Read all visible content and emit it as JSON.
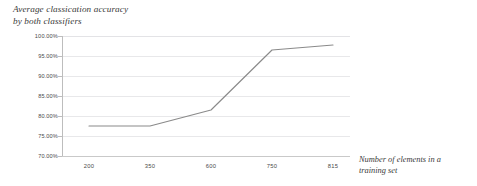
{
  "chart_data": {
    "type": "line",
    "title": "Average  classication accuracy by both classifiers",
    "title_line1": "Average  classication accuracy",
    "title_line2": "by both classifiers",
    "xlabel": "Number of elements in a training set",
    "xlabel_line1": "Number of elements in a",
    "xlabel_line2": "training set",
    "ylabel": "",
    "categories": [
      "200",
      "350",
      "600",
      "750",
      "815"
    ],
    "x": [
      200,
      350,
      600,
      750,
      815
    ],
    "values": [
      77.5,
      77.5,
      81.5,
      96.5,
      97.75
    ],
    "series": [
      {
        "name": "Average classication accuracy by both classifiers",
        "values": [
          77.5,
          77.5,
          81.5,
          96.5,
          97.75
        ]
      }
    ],
    "ylim": [
      70,
      100
    ],
    "y_ticks": [
      100,
      95,
      90,
      85,
      80,
      75,
      70
    ],
    "y_tick_labels": [
      "100.00%",
      "95.00%",
      "90.00%",
      "85.00%",
      "80.00%",
      "75.00%",
      "70.00%"
    ],
    "x_tick_labels": [
      "200",
      "350",
      "600",
      "750",
      "815"
    ],
    "grid": true,
    "grid_axis": "y",
    "legend": false,
    "legend_position": "none",
    "line_color": "#8a8a8a",
    "grid_color": "#e8e8ea",
    "axis_color": "#bdbdbd",
    "background": "#ffffff",
    "text_color": "#3a3a3a"
  }
}
